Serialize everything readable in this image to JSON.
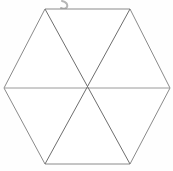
{
  "figure": {
    "shape_name": "regular-hexagon",
    "canvas": {
      "width": 173,
      "height": 171,
      "background_color": "#fefefe"
    },
    "stroke": {
      "outline_color": "#8a8a8a",
      "diagonal_color": "#6e6e6e",
      "horizontal_color": "#9a9a9a",
      "width": 1
    },
    "vertices": [
      {
        "name": "top-left",
        "x": 45,
        "y": 9
      },
      {
        "name": "top-right",
        "x": 130,
        "y": 9
      },
      {
        "name": "right",
        "x": 170,
        "y": 88
      },
      {
        "name": "bottom-right",
        "x": 130,
        "y": 164
      },
      {
        "name": "bottom-left",
        "x": 45,
        "y": 164
      },
      {
        "name": "left",
        "x": 4,
        "y": 88
      }
    ],
    "center": {
      "name": "center",
      "x": 87,
      "y": 88
    },
    "outline_points": "45,9 130,9 170,88 130,164 45,164 4,88",
    "diagonals": [
      {
        "name": "diagonal-left-to-right",
        "x1": 4,
        "y1": 88,
        "x2": 170,
        "y2": 88
      },
      {
        "name": "diagonal-topleft-to-bottomright",
        "x1": 45,
        "y1": 9,
        "x2": 130,
        "y2": 164
      },
      {
        "name": "diagonal-topright-to-bottomleft",
        "x1": 130,
        "y1": 9,
        "x2": 45,
        "y2": 164
      }
    ],
    "triangle_count": 6,
    "artifacts": {
      "top_mark": {
        "name": "handwritten-descender-mark",
        "path": "M 62 1 C 66 2 68 4 67 7 C 66 9 63 9 61 8",
        "color": "#b5b5b5",
        "stroke_width": 2
      },
      "speck": {
        "name": "scan-speck",
        "x": 121,
        "y": 73,
        "r": 2,
        "color": "#ededed"
      }
    }
  }
}
